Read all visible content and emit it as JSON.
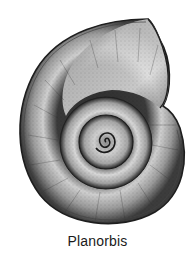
{
  "figure": {
    "caption": "Planorbis",
    "colors": {
      "background": "#ffffff",
      "outline": "#1e1e1e",
      "shadow": "#2a2a2a",
      "highlight": "#e6e6e6",
      "caption_text": "#1a1a1a"
    }
  }
}
